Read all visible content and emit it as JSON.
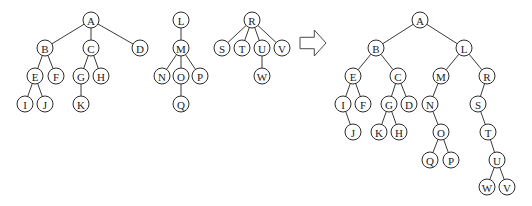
{
  "diagram": {
    "node_radius": 8,
    "colors": {
      "stroke": "#2b2b2b",
      "fill": "#ffffff",
      "text": "#1a1a1a"
    },
    "forest": {
      "trees": [
        {
          "root": "A",
          "nodes": [
            {
              "id": "A",
              "x": 91,
              "y": 20
            },
            {
              "id": "B",
              "x": 45,
              "y": 48
            },
            {
              "id": "C",
              "x": 91,
              "y": 48
            },
            {
              "id": "D",
              "x": 140,
              "y": 48
            },
            {
              "id": "E",
              "x": 35,
              "y": 76
            },
            {
              "id": "F",
              "x": 56,
              "y": 76
            },
            {
              "id": "G",
              "x": 81,
              "y": 76
            },
            {
              "id": "H",
              "x": 101,
              "y": 76
            },
            {
              "id": "I",
              "x": 25,
              "y": 104
            },
            {
              "id": "J",
              "x": 45,
              "y": 104
            },
            {
              "id": "K",
              "x": 81,
              "y": 104
            }
          ],
          "edges": [
            [
              "A",
              "B"
            ],
            [
              "A",
              "C"
            ],
            [
              "A",
              "D"
            ],
            [
              "B",
              "E"
            ],
            [
              "B",
              "F"
            ],
            [
              "C",
              "G"
            ],
            [
              "C",
              "H"
            ],
            [
              "E",
              "I"
            ],
            [
              "E",
              "J"
            ],
            [
              "G",
              "K"
            ]
          ]
        },
        {
          "root": "L",
          "nodes": [
            {
              "id": "L",
              "x": 181,
              "y": 20
            },
            {
              "id": "M",
              "x": 181,
              "y": 48
            },
            {
              "id": "N",
              "x": 162,
              "y": 76
            },
            {
              "id": "O",
              "x": 181,
              "y": 76
            },
            {
              "id": "P",
              "x": 200,
              "y": 76
            },
            {
              "id": "Q",
              "x": 181,
              "y": 104
            }
          ],
          "edges": [
            [
              "L",
              "M"
            ],
            [
              "M",
              "N"
            ],
            [
              "M",
              "O"
            ],
            [
              "M",
              "P"
            ],
            [
              "O",
              "Q"
            ]
          ]
        },
        {
          "root": "R",
          "nodes": [
            {
              "id": "R",
              "x": 252,
              "y": 20
            },
            {
              "id": "S",
              "x": 222,
              "y": 48
            },
            {
              "id": "T",
              "x": 242,
              "y": 48
            },
            {
              "id": "U",
              "x": 262,
              "y": 48
            },
            {
              "id": "V",
              "x": 282,
              "y": 48
            },
            {
              "id": "W",
              "x": 262,
              "y": 76
            }
          ],
          "edges": [
            [
              "R",
              "S"
            ],
            [
              "R",
              "T"
            ],
            [
              "R",
              "U"
            ],
            [
              "R",
              "V"
            ],
            [
              "U",
              "W"
            ]
          ]
        }
      ]
    },
    "arrow": {
      "direction": "right",
      "x": 300,
      "y": 30,
      "width": 26,
      "height": 26
    },
    "binary_tree": {
      "root": "A",
      "nodes": [
        {
          "id": "A",
          "x": 420,
          "y": 20
        },
        {
          "id": "B",
          "x": 376,
          "y": 48
        },
        {
          "id": "L",
          "x": 464,
          "y": 48
        },
        {
          "id": "E",
          "x": 353,
          "y": 76
        },
        {
          "id": "C",
          "x": 398,
          "y": 76
        },
        {
          "id": "M",
          "x": 441,
          "y": 76
        },
        {
          "id": "R",
          "x": 487,
          "y": 76
        },
        {
          "id": "I",
          "x": 343,
          "y": 104
        },
        {
          "id": "F",
          "x": 363,
          "y": 104
        },
        {
          "id": "G",
          "x": 389,
          "y": 104
        },
        {
          "id": "D",
          "x": 409,
          "y": 104
        },
        {
          "id": "N",
          "x": 430,
          "y": 104
        },
        {
          "id": "S",
          "x": 478,
          "y": 104
        },
        {
          "id": "J",
          "x": 353,
          "y": 132
        },
        {
          "id": "K",
          "x": 379,
          "y": 132
        },
        {
          "id": "H",
          "x": 399,
          "y": 132
        },
        {
          "id": "O",
          "x": 441,
          "y": 132
        },
        {
          "id": "T",
          "x": 488,
          "y": 132
        },
        {
          "id": "Q",
          "x": 430,
          "y": 160
        },
        {
          "id": "P",
          "x": 451,
          "y": 160
        },
        {
          "id": "U",
          "x": 497,
          "y": 160
        },
        {
          "id": "W",
          "x": 487,
          "y": 187
        },
        {
          "id": "V",
          "x": 507,
          "y": 187
        }
      ],
      "edges": [
        [
          "A",
          "B"
        ],
        [
          "A",
          "L"
        ],
        [
          "B",
          "E"
        ],
        [
          "B",
          "C"
        ],
        [
          "L",
          "M"
        ],
        [
          "L",
          "R"
        ],
        [
          "E",
          "I"
        ],
        [
          "E",
          "F"
        ],
        [
          "C",
          "G"
        ],
        [
          "C",
          "D"
        ],
        [
          "M",
          "N"
        ],
        [
          "R",
          "S"
        ],
        [
          "I",
          "J"
        ],
        [
          "G",
          "K"
        ],
        [
          "G",
          "H"
        ],
        [
          "N",
          "O"
        ],
        [
          "S",
          "T"
        ],
        [
          "O",
          "Q"
        ],
        [
          "O",
          "P"
        ],
        [
          "T",
          "U"
        ],
        [
          "U",
          "W"
        ],
        [
          "U",
          "V"
        ]
      ]
    }
  }
}
